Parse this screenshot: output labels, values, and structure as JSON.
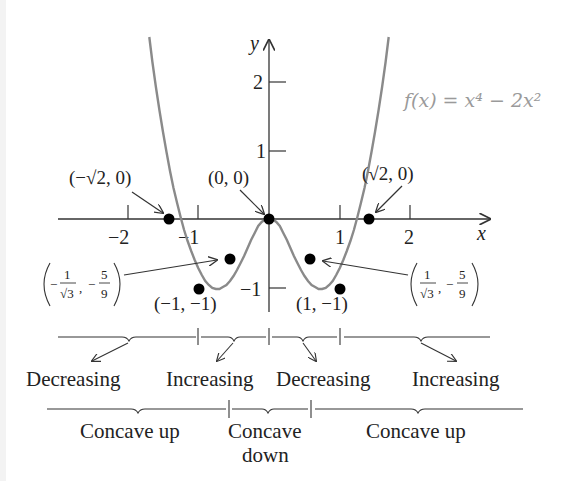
{
  "function_label": "f(x) = x⁴ − 2x²",
  "axes": {
    "x_label": "x",
    "y_label": "y",
    "x_ticks": [
      "−2",
      "−1",
      "1",
      "2"
    ],
    "y_ticks": [
      "2",
      "1",
      "−1"
    ]
  },
  "points": {
    "zero_left": "(−√2, 0)",
    "origin": "(0, 0)",
    "zero_right": "(√2, 0)",
    "min_left": "(−1, −1)",
    "min_right": "(1, −1)",
    "inflection_left": {
      "num_x": "1",
      "den_x": "√3",
      "sign_x": "−",
      "num_y": "5",
      "den_y": "9",
      "sign_y": "−"
    },
    "inflection_right": {
      "num_x": "1",
      "den_x": "√3",
      "sign_x": "",
      "num_y": "5",
      "den_y": "9",
      "sign_y": "−"
    }
  },
  "monotonicity": [
    "Decreasing",
    "Increasing",
    "Decreasing",
    "Increasing"
  ],
  "concavity": [
    "Concave up",
    "Concave",
    "down",
    "Concave up"
  ],
  "colors": {
    "curve": "#8a8a8a",
    "axis": "#333333",
    "point": "#000000",
    "label_gray": "#9a9a9a"
  }
}
